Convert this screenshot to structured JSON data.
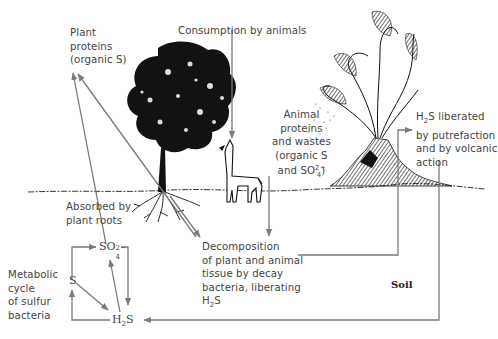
{
  "diagram": {
    "labels": {
      "plant_proteins": [
        "Plant",
        "proteins",
        "(organic S)"
      ],
      "consumption": "Consumption by animals",
      "animal_proteins": [
        "Animal",
        "proteins",
        "and wastes",
        "(organic S",
        "and SO"
      ],
      "animal_proteins_sup": "2−",
      "animal_proteins_sub": "4",
      "animal_proteins_end": ")",
      "h2s_liberated_prefix": "H",
      "h2s_liberated_sub": "2",
      "h2s_liberated_rest": "S liberated",
      "h2s_liberated_lines": [
        "by putrefaction",
        "and by volcanic",
        "action"
      ],
      "absorbed": [
        "Absorbed by",
        "plant roots"
      ],
      "decomposition": [
        "Decomposition",
        "of plant and animal",
        "tissue by decay",
        "bacteria, liberating"
      ],
      "decomposition_h2s_prefix": "H",
      "decomposition_h2s_sub": "2",
      "decomposition_h2s_suffix": "S",
      "metabolic": [
        "Metabolic",
        "cycle",
        "of sulfur",
        "bacteria"
      ],
      "soil": "Soil"
    },
    "nodes": {
      "so4_base": "SO",
      "so4_sup": "2−",
      "so4_sub": "4",
      "s": "S",
      "h2s_prefix": "H",
      "h2s_sub": "2",
      "h2s_suffix": "S"
    },
    "colors": {
      "arrow": "#7a7a7a",
      "ink": "#111111",
      "text": "#444444"
    },
    "flows": [
      "Absorbed by plant roots → Plant proteins (organic S)",
      "Plant proteins → Decomposition",
      "Consumption by animals → Animal",
      "Animal proteins and wastes → Decomposition",
      "Decomposition → H2S liberated by putrefaction and by volcanic action",
      "H2S liberated → H2S (soil)",
      "SO4 → H2S",
      "H2S → SO4",
      "S → H2S",
      "H2S → S",
      "S → SO4"
    ]
  }
}
